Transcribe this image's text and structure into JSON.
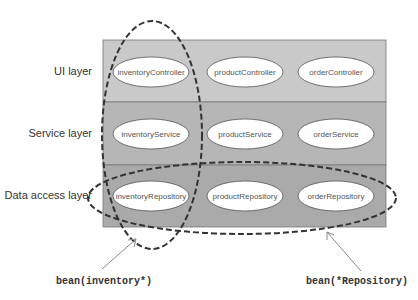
{
  "layers": [
    {
      "label": "UI layer",
      "color": "#c9c9c9",
      "beans": [
        "inventoryController",
        "productController",
        "orderController"
      ]
    },
    {
      "label": "Service layer",
      "color": "#b6b6b6",
      "beans": [
        "inventoryService",
        "productService",
        "orderService"
      ]
    },
    {
      "label": "Data access layer",
      "color": "#aaaaaa",
      "beans": [
        "inventoryRepository",
        "productRepository",
        "orderRepository"
      ]
    }
  ],
  "pointcuts": [
    {
      "expression": "bean(inventory*)",
      "selects": "inventory column"
    },
    {
      "expression": "bean(*Repository)",
      "selects": "data access row"
    }
  ],
  "colors": {
    "border": "#666666",
    "bean_fill": "#ffffff",
    "dashed": "#333333",
    "arrow": "#888888"
  }
}
